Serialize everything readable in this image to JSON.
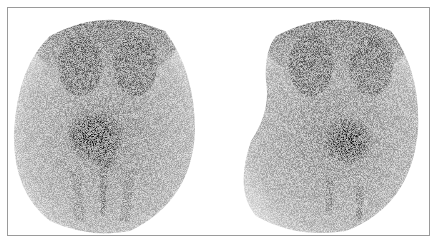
{
  "figure": {
    "panels": [
      {
        "id": "left",
        "label": ""
      },
      {
        "id": "right",
        "label": ""
      }
    ],
    "colors": {
      "background": "#ffffff",
      "border": "#9a9a9a",
      "uptake_dark": "#1a1a1a",
      "uptake_light": "#d8d8d8"
    }
  }
}
